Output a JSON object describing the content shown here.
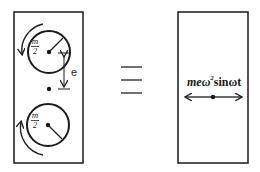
{
  "diagram": {
    "left_panel": {
      "upper_mass": {
        "numerator": "m",
        "denominator": "2",
        "rotation": "counterclockwise"
      },
      "lower_mass": {
        "numerator": "m",
        "denominator": "2",
        "rotation": "clockwise"
      },
      "eccentricity_label": "e"
    },
    "equivalence_symbol": "≡",
    "right_panel": {
      "force_label_prefix": "meω",
      "force_label_exponent": "2",
      "force_label_suffix": "sinωt"
    },
    "colors": {
      "stroke": "#1a1a1a",
      "background": "#ffffff"
    }
  }
}
